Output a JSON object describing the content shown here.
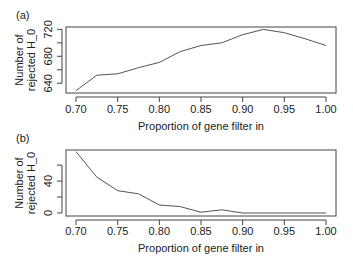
{
  "chart_data": [
    {
      "panel_label": "(a)",
      "type": "line",
      "title": "",
      "xlabel": "Proportion of gene filter in",
      "ylabel_lines": [
        "Number of",
        "rejected H_0"
      ],
      "x": [
        0.7,
        0.725,
        0.75,
        0.775,
        0.8,
        0.825,
        0.85,
        0.875,
        0.9,
        0.925,
        0.95,
        0.975,
        1.0
      ],
      "values": [
        629,
        652,
        654,
        663,
        671,
        687,
        696,
        700,
        712,
        720,
        715,
        706,
        696
      ],
      "xticks": [
        0.7,
        0.75,
        0.8,
        0.85,
        0.9,
        0.95,
        1.0
      ],
      "xtick_labels": [
        "0.70",
        "0.75",
        "0.80",
        "0.85",
        "0.90",
        "0.95",
        "1.00"
      ],
      "yticks": [
        640,
        660,
        680,
        700,
        720
      ],
      "ytick_labels": [
        "640",
        "",
        "680",
        "",
        "720"
      ],
      "xlim": [
        0.688,
        1.012
      ],
      "ylim": [
        625.5,
        723.5
      ],
      "grid": false,
      "legend": null,
      "line_color": "#555555"
    },
    {
      "panel_label": "(b)",
      "type": "line",
      "title": "",
      "xlabel": "Proportion of gene filter in",
      "ylabel_lines": [
        "Number of",
        "rejected H_0"
      ],
      "x": [
        0.7,
        0.725,
        0.75,
        0.775,
        0.8,
        0.825,
        0.85,
        0.875,
        0.9,
        0.925,
        0.95,
        0.975,
        1.0
      ],
      "values": [
        77,
        45,
        28,
        24,
        10,
        8,
        1,
        4,
        0,
        0,
        0,
        0,
        0
      ],
      "xticks": [
        0.7,
        0.75,
        0.8,
        0.85,
        0.9,
        0.95,
        1.0
      ],
      "xtick_labels": [
        "0.70",
        "0.75",
        "0.80",
        "0.85",
        "0.90",
        "0.95",
        "1.00"
      ],
      "yticks": [
        0,
        20,
        40,
        60
      ],
      "ytick_labels": [
        "0",
        "",
        "40",
        ""
      ],
      "xlim": [
        0.688,
        1.012
      ],
      "ylim": [
        -3.8,
        79
      ],
      "grid": false,
      "legend": null,
      "line_color": "#555555"
    }
  ],
  "layout": {
    "panels": [
      {
        "box": {
          "x": 66,
          "y": 27,
          "w": 270,
          "h": 66
        },
        "label_pos": {
          "x": 16,
          "y": 19
        },
        "xlabel_y": 130,
        "ticklabel_y": 113,
        "ylabel_x": [
          23,
          35
        ],
        "yticklabel_x": 52
      },
      {
        "box": {
          "x": 66,
          "y": 150,
          "w": 270,
          "h": 66
        },
        "label_pos": {
          "x": 16,
          "y": 142
        },
        "xlabel_y": 252,
        "ticklabel_y": 235,
        "ylabel_x": [
          23,
          35
        ],
        "yticklabel_x": 52
      }
    ],
    "colors": {
      "axis": "#444444",
      "text": "#222222",
      "background": "#ffffff"
    }
  }
}
